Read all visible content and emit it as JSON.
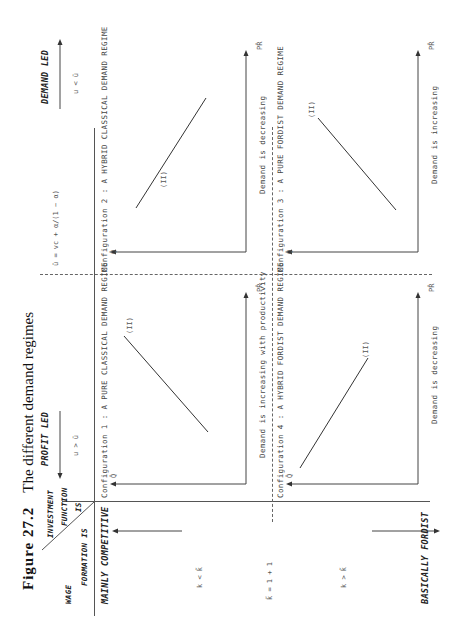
{
  "figure": {
    "number": "Figure  27.2",
    "title": "The different demand regimes"
  },
  "corner": {
    "top_line1": "INVESTMENT",
    "top_line2": "FUNCTION",
    "top_line3": "IS",
    "bottom_line1": "WAGE",
    "bottom_line2": "FORMATION IS"
  },
  "columns": [
    {
      "label": "PROFIT LED",
      "condition": "u > ū"
    },
    {
      "label": "DEMAND LED",
      "condition": "u < ū"
    }
  ],
  "column_boundary": "ū = vc + α/(1 − α)",
  "rows": [
    {
      "label": "MAINLY COMPETITIVE",
      "condition": "k < k̃"
    },
    {
      "label": "BASICALLY FORDIST",
      "condition": "k > k̃"
    }
  ],
  "row_boundary": "k̃ = 1 + 1",
  "cells": [
    {
      "config": "Configuration 1 : A PURE CLASSICAL DEMAND REGIME",
      "curve": "(II)",
      "note": "Demand is increasing with productivity",
      "y_axis": "Q̂",
      "x_axis": "PR̂"
    },
    {
      "config": "Configuration 2 : A HYBRID CLASSICAL DEMAND REGIME",
      "curve": "(II)",
      "note": "Demand is decreasing",
      "y_axis": "Q̂",
      "x_axis": "PR̂"
    },
    {
      "config": "Configuration 4 : A HYBRID FORDIST DEMAND REGIME",
      "curve": "(II)",
      "note": "Demand is decreasing",
      "y_axis": "Q̂",
      "x_axis": "PR̂"
    },
    {
      "config": "Configuration 3 : A PURE FORDIST DEMAND REGIME",
      "curve": "(II)",
      "note": "Demand is increasing",
      "y_axis": "Q̂",
      "x_axis": "PR̂"
    }
  ]
}
